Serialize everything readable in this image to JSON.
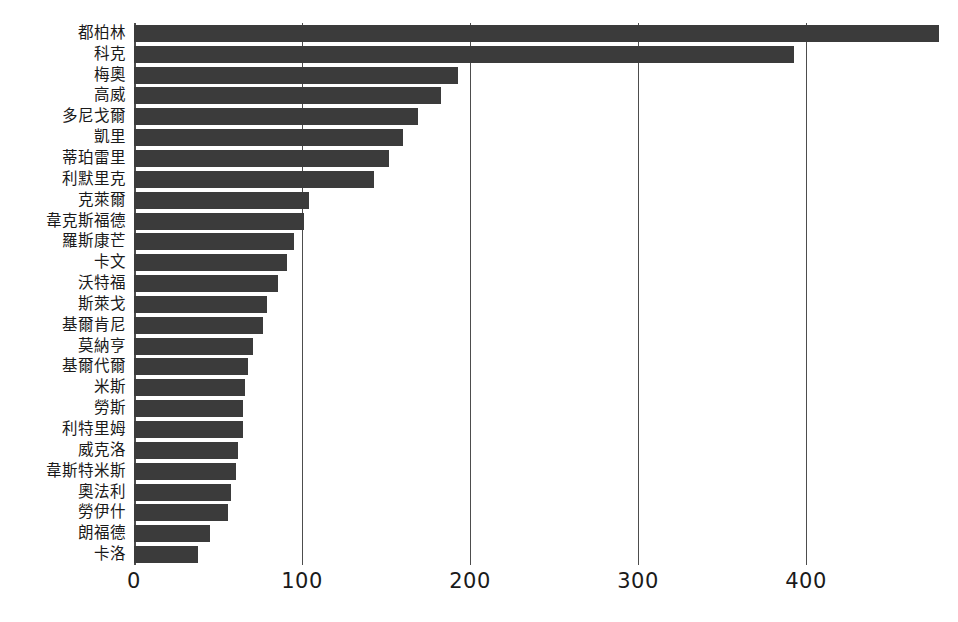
{
  "chart_data": {
    "type": "bar",
    "orientation": "horizontal",
    "title": "",
    "subtitle": "",
    "xlabel": "",
    "ylabel": "",
    "xlim": [
      0,
      483
    ],
    "xticks": [
      0,
      100,
      200,
      300,
      400
    ],
    "xtick_labels": [
      "0",
      "100",
      "200",
      "300",
      "400"
    ],
    "grid": true,
    "grid_axis": "x",
    "legend": false,
    "legend_position": "none",
    "bar_color": "#3b3b3b",
    "axis_color": "#4d4d4d",
    "background_color": "#ffffff",
    "categories": [
      "都柏林",
      "科克",
      "梅奧",
      "高威",
      "多尼戈爾",
      "凱里",
      "蒂珀雷里",
      "利默里克",
      "克萊爾",
      "韋克斯福德",
      "羅斯康芒",
      "卡文",
      "沃特福",
      "斯萊戈",
      "基爾肯尼",
      "莫納亨",
      "基爾代爾",
      "米斯",
      "勞斯",
      "利特里姆",
      "威克洛",
      "韋斯特米斯",
      "奧法利",
      "勞伊什",
      "朗福德",
      "卡洛"
    ],
    "values": [
      479,
      393,
      193,
      183,
      169,
      160,
      152,
      143,
      104,
      101,
      95,
      91,
      86,
      79,
      77,
      71,
      68,
      66,
      65,
      65,
      62,
      61,
      58,
      56,
      45,
      38
    ]
  }
}
